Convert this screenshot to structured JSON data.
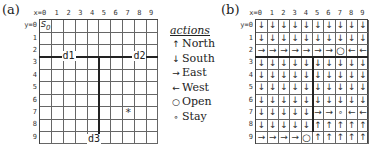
{
  "panel_a": {
    "label": "(a)",
    "x_ticks": [
      "x=0",
      "1",
      "2",
      "3",
      "4",
      "5",
      "6",
      "7",
      "8",
      "9"
    ],
    "y_ticks": [
      "y=0",
      "1",
      "2",
      "3",
      "4",
      "5",
      "6",
      "7",
      "8",
      "9"
    ],
    "start_label": "s",
    "start_sub": "0",
    "goal_marker": "*",
    "goal_cell": {
      "x": 7,
      "y": 7
    },
    "doors": [
      {
        "label": "d1",
        "x": 2,
        "y": 2.5
      },
      {
        "label": "d2",
        "x": 8,
        "y": 2.5
      },
      {
        "label": "d3",
        "x": 4.5,
        "y": 9
      }
    ]
  },
  "legend": {
    "title": "actions",
    "items": [
      {
        "symbol": "↑",
        "label": "North"
      },
      {
        "symbol": "↓",
        "label": "South"
      },
      {
        "symbol": "→",
        "label": "East"
      },
      {
        "symbol": "←",
        "label": "West"
      },
      {
        "symbol": "○",
        "label": "Open"
      },
      {
        "symbol": "∘",
        "label": "Stay"
      }
    ]
  },
  "panel_b": {
    "label": "(b)",
    "x_ticks": [
      "x=0",
      "1",
      "2",
      "3",
      "4",
      "5",
      "6",
      "7",
      "8",
      "9"
    ],
    "y_ticks": [
      "y=0",
      "1",
      "2",
      "3",
      "4",
      "5",
      "6",
      "7",
      "8",
      "9"
    ],
    "policy": [
      [
        "↓",
        "↓",
        "↓",
        "↓",
        "↓",
        "↓",
        "↓",
        "↓",
        "↓",
        "↓"
      ],
      [
        "↓",
        "↓",
        "↓",
        "↓",
        "↓",
        "↓",
        "↓",
        "↓",
        "↓",
        "↓"
      ],
      [
        "→",
        "→",
        "→",
        "→",
        "→",
        "→",
        "→",
        "○",
        "←",
        "←"
      ],
      [
        "↓",
        "↓",
        "↓",
        "↓",
        "↓",
        "↓",
        "↓",
        "↓",
        "↓",
        "↓"
      ],
      [
        "↓",
        "↓",
        "↓",
        "↓",
        "↓",
        "↓",
        "↓",
        "↓",
        "↓",
        "↓"
      ],
      [
        "↓",
        "↓",
        "↓",
        "↓",
        "↓",
        "↓",
        "↓",
        "↓",
        "↓",
        "↓"
      ],
      [
        "↓",
        "↓",
        "↓",
        "↓",
        "↓",
        "↓",
        "↓",
        "↓",
        "↓",
        "↓"
      ],
      [
        "↓",
        "↓",
        "↓",
        "↓",
        "↓",
        "→",
        "→",
        "∘",
        "←",
        "←"
      ],
      [
        "↓",
        "↓",
        "↓",
        "↓",
        "↓",
        "↑",
        "↑",
        "↑",
        "↑",
        "↑"
      ],
      [
        "→",
        "→",
        "→",
        "→",
        "○",
        "↑",
        "↑",
        "↑",
        "↑",
        "↑"
      ]
    ]
  }
}
